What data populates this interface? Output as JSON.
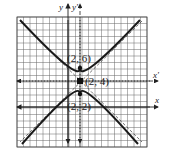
{
  "diagram": {
    "type": "hyperbola-graph",
    "axes": {
      "x_label": "x",
      "y_label": "y",
      "x_prime_label": "x'",
      "y_prime_label": "y'"
    },
    "center": {
      "label": "(2, 4)",
      "x": 2,
      "y": 4
    },
    "vertices": [
      {
        "label": "(2, 6)",
        "x": 2,
        "y": 6
      },
      {
        "label": "(2, 2)",
        "x": 2,
        "y": 2
      }
    ],
    "colors": {
      "curve": "#1a1a1a",
      "grid": "#555555",
      "background": "#ffffff"
    }
  }
}
